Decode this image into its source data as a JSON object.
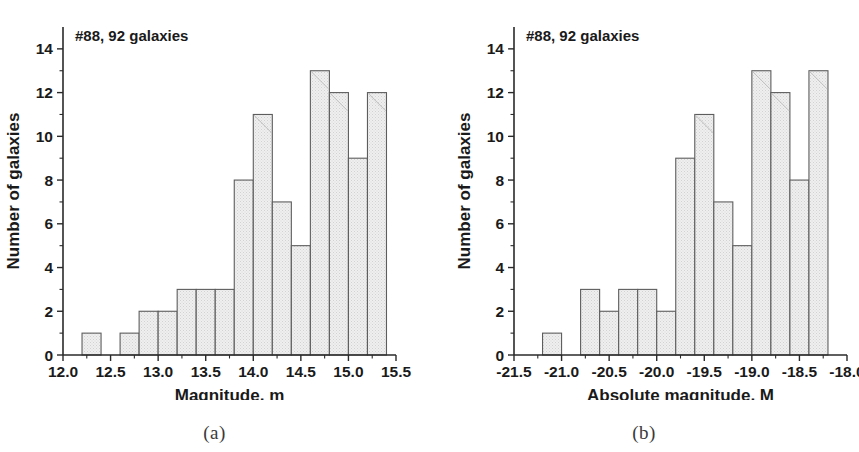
{
  "figure": {
    "background": "#ffffff",
    "bar_fill": "#e8e8e8",
    "bar_stroke": "#5d5d5d",
    "axis_color": "#2a2a2a"
  },
  "panels": [
    {
      "key": "a",
      "caption": "(a)",
      "annotation": "#88, 92 galaxies",
      "ylabel": "Number of galaxies",
      "xlabel": "Magnitude, m",
      "xticks": [
        "12.0",
        "12.5",
        "13.0",
        "13.5",
        "14.0",
        "14.5",
        "15.0",
        "15.5"
      ],
      "yticks": [
        "0",
        "2",
        "4",
        "6",
        "8",
        "10",
        "12",
        "14"
      ]
    },
    {
      "key": "b",
      "caption": "(b)",
      "annotation": "#88, 92 galaxies",
      "ylabel": "Number of galaxies",
      "xlabel": "Absolute magnitude, M",
      "xticks": [
        "-21.5",
        "-21.0",
        "-20.5",
        "-20.0",
        "-19.5",
        "-19.0",
        "-18.5",
        "-18.0"
      ],
      "yticks": [
        "0",
        "2",
        "4",
        "6",
        "8",
        "10",
        "12",
        "14"
      ]
    }
  ],
  "chart_data": [
    {
      "type": "bar",
      "title": "#88, 92 galaxies",
      "panel": "(a)",
      "xlabel": "Magnitude, m",
      "ylabel": "Number of galaxies",
      "xlim": [
        12.0,
        15.5
      ],
      "ylim": [
        0,
        15
      ],
      "xticks": [
        12.0,
        12.5,
        13.0,
        13.5,
        14.0,
        14.5,
        15.0,
        15.5
      ],
      "yticks": [
        0,
        2,
        4,
        6,
        8,
        10,
        12,
        14
      ],
      "grid": false,
      "legend": "none",
      "bin_width": 0.2,
      "bin_edges": [
        12.2,
        12.4,
        12.6,
        12.8,
        13.0,
        13.2,
        13.4,
        13.6,
        13.8,
        14.0,
        14.2,
        14.4,
        14.6,
        14.8,
        15.0,
        15.2,
        15.4
      ],
      "categories": [
        "12.2-12.4",
        "12.4-12.6",
        "12.6-12.8",
        "12.8-13.0",
        "13.0-13.2",
        "13.2-13.4",
        "13.4-13.6",
        "13.6-13.8",
        "13.8-14.0",
        "14.0-14.2",
        "14.2-14.4",
        "14.4-14.6",
        "14.6-14.8",
        "14.8-15.0",
        "15.0-15.2",
        "15.2-15.4"
      ],
      "values": [
        1,
        0,
        1,
        2,
        2,
        3,
        3,
        3,
        8,
        11,
        7,
        5,
        13,
        12,
        9,
        12
      ],
      "total": 92
    },
    {
      "type": "bar",
      "title": "#88, 92 galaxies",
      "panel": "(b)",
      "xlabel": "Absolute magnitude, M",
      "ylabel": "Number of galaxies",
      "xlim": [
        -21.5,
        -18.0
      ],
      "ylim": [
        0,
        15
      ],
      "xticks": [
        -21.5,
        -21.0,
        -20.5,
        -20.0,
        -19.5,
        -19.0,
        -18.5,
        -18.0
      ],
      "yticks": [
        0,
        2,
        4,
        6,
        8,
        10,
        12,
        14
      ],
      "grid": false,
      "legend": "none",
      "bin_width": 0.2,
      "bin_edges": [
        -21.2,
        -21.0,
        -20.8,
        -20.6,
        -20.4,
        -20.2,
        -20.0,
        -19.8,
        -19.6,
        -19.4,
        -19.2,
        -19.0,
        -18.8,
        -18.6,
        -18.4,
        -18.2
      ],
      "categories": [
        "-21.2..-21.0",
        "-21.0..-20.8",
        "-20.8..-20.6",
        "-20.6..-20.4",
        "-20.4..-20.2",
        "-20.2..-20.0",
        "-20.0..-19.8",
        "-19.8..-19.6",
        "-19.6..-19.4",
        "-19.4..-19.2",
        "-19.2..-19.0",
        "-19.0..-18.8",
        "-18.8..-18.6",
        "-18.6..-18.4",
        "-18.4..-18.2"
      ],
      "values": [
        1,
        0,
        3,
        2,
        3,
        3,
        2,
        9,
        11,
        7,
        5,
        13,
        12,
        8,
        13
      ],
      "total": 92
    }
  ]
}
